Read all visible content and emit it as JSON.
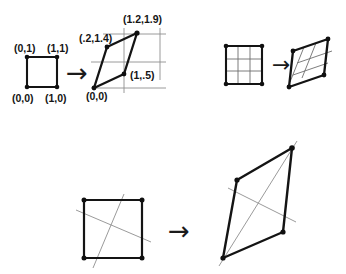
{
  "figure": {
    "background_color": "#ffffff",
    "stroke_color": "#141414",
    "guide_color": "#8e8e8e",
    "grid_color": "#6e6e6e",
    "panels": [
      {
        "id": "panel-coordinates",
        "name": "labeled-unit-square-to-parallelogram",
        "arrow": "→",
        "source": {
          "name": "unit-square",
          "vertices": [
            {
              "label": "(0,1)",
              "x": 0,
              "y": 1
            },
            {
              "label": "(1,1)",
              "x": 1,
              "y": 1
            },
            {
              "label": "(1,0)",
              "x": 1,
              "y": 0
            },
            {
              "label": "(0,0)",
              "x": 0,
              "y": 0
            }
          ]
        },
        "target": {
          "name": "image-parallelogram",
          "vertices": [
            {
              "label": "(0,0)",
              "x": 0,
              "y": 0
            },
            {
              "label": "(1,.5)",
              "x": 1,
              "y": 0.5
            },
            {
              "label": "(1.2,1.9)",
              "x": 1.2,
              "y": 1.9
            },
            {
              "label": "(.2,1.4)",
              "x": 0.2,
              "y": 1.4
            }
          ]
        }
      },
      {
        "id": "panel-grid",
        "name": "grid-square-to-sheared-grid",
        "arrow": "→",
        "source": {
          "name": "grid-square",
          "grid_divisions": 3
        },
        "target": {
          "name": "sheared-grid-parallelogram",
          "grid_divisions": 3
        }
      },
      {
        "id": "panel-lines",
        "name": "square-with-lines-to-parallelogram-with-lines",
        "arrow": "→",
        "source": {
          "name": "square-with-crossing-lines",
          "line_count": 2
        },
        "target": {
          "name": "parallelogram-with-crossing-lines",
          "line_count": 2
        }
      }
    ]
  }
}
